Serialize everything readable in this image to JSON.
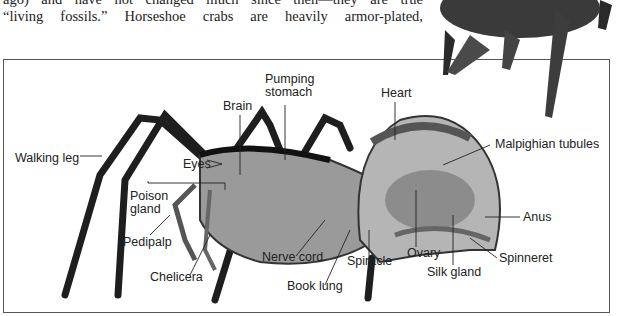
{
  "prose": {
    "lines": [
      "ago) and have not changed much since then—they are true",
      "“living fossils.” Horseshoe crabs are heavily armor-plated,"
    ]
  },
  "figure": {
    "labels": {
      "walking_leg": "Walking leg",
      "eyes": "Eyes",
      "brain": "Brain",
      "pumping_stomach_1": "Pumping",
      "pumping_stomach_2": "stomach",
      "heart": "Heart",
      "malpighian": "Malpighian tubules",
      "poison_gland_1": "Poison",
      "poison_gland_2": "gland",
      "pedipalp": "Pedipalp",
      "chelicera": "Chelicera",
      "nerve_cord": "Nerve cord",
      "book_lung": "Book lung",
      "spiracle": "Spiracle",
      "ovary": "Ovary",
      "silk_gland": "Silk gland",
      "spinneret": "Spinneret",
      "anus": "Anus"
    }
  }
}
